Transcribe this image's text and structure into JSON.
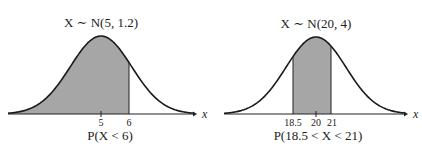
{
  "chart_data": [
    {
      "type": "area",
      "title": "X ~ N(5, 1.2)",
      "distribution": {
        "name": "Normal",
        "mean": 5,
        "variance": 1.2
      },
      "xlabel": "x",
      "ticks": [
        "5",
        "6"
      ],
      "shaded_region": {
        "from": "-inf",
        "to": 6
      },
      "caption": "P(X < 6)"
    },
    {
      "type": "area",
      "title": "X ~ N(20, 4)",
      "distribution": {
        "name": "Normal",
        "mean": 20,
        "variance": 4
      },
      "xlabel": "x",
      "ticks": [
        "18.5",
        "20",
        "21"
      ],
      "shaded_region": {
        "from": 18.5,
        "to": 21
      },
      "caption": "P(18.5 < X < 21)"
    }
  ],
  "panels": {
    "left": {
      "title": "X ∼ N(5, 1.2)",
      "tick_a": "5",
      "tick_b": "6",
      "axis_label": "x",
      "caption": "P(X < 6)"
    },
    "right": {
      "title": "X ∼ N(20, 4)",
      "tick_a": "18.5",
      "tick_b": "20",
      "tick_c": "21",
      "axis_label": "x",
      "caption": "P(18.5 < X < 21)"
    }
  },
  "colors": {
    "shade": "#a6a6a6",
    "curve": "#1a1a1a"
  }
}
